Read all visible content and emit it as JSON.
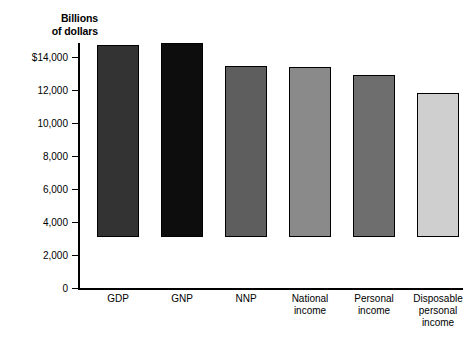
{
  "chart_data": {
    "type": "bar",
    "title": "",
    "ylabel": "Billions of dollars",
    "ylabel_lines": [
      "Billions",
      "of dollars"
    ],
    "xlabel": "",
    "ylim": [
      0,
      14000
    ],
    "grid": false,
    "legend": "none",
    "y_ticks": [
      {
        "value": 14000,
        "label": "$14,000"
      },
      {
        "value": 12000,
        "label": "12,000"
      },
      {
        "value": 10000,
        "label": "10,000"
      },
      {
        "value": 8000,
        "label": "8,000"
      },
      {
        "value": 6000,
        "label": "6,000"
      },
      {
        "value": 4000,
        "label": "4,000"
      },
      {
        "value": 2000,
        "label": "2,000"
      },
      {
        "value": 0,
        "label": "0"
      }
    ],
    "categories": [
      "GDP",
      "GNP",
      "NNP",
      "National income",
      "Personal income",
      "Disposable personal income"
    ],
    "category_label_lines": [
      [
        "GDP"
      ],
      [
        "GNP"
      ],
      [
        "NNP"
      ],
      [
        "National",
        "income"
      ],
      [
        "Personal",
        "income"
      ],
      [
        "Disposable",
        "personal",
        "income"
      ]
    ],
    "values": [
      11650,
      11750,
      10350,
      10300,
      9800,
      8700
    ],
    "bar_colors": [
      "#333333",
      "#0d0d0d",
      "#5e5e5e",
      "#8a8a8a",
      "#6e6e6e",
      "#cfcfcf"
    ],
    "bar_border_color": "#000000"
  }
}
